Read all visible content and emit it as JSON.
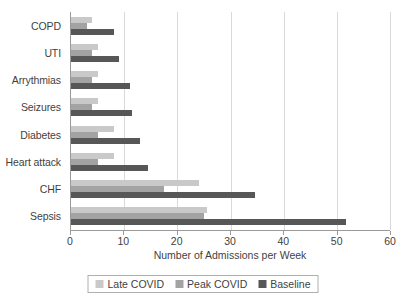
{
  "chart_data": {
    "type": "bar",
    "orientation": "horizontal",
    "title": "",
    "xlabel": "Number of Admissions per Week",
    "ylabel": "",
    "xlim": [
      0,
      60
    ],
    "xticks": [
      0,
      10,
      20,
      30,
      40,
      50,
      60
    ],
    "grid": true,
    "legend_position": "bottom",
    "categories": [
      "COPD",
      "UTI",
      "Arrythmias",
      "Seizures",
      "Diabetes",
      "Heart attack",
      "CHF",
      "Sepsis"
    ],
    "series": [
      {
        "name": "Late COVID",
        "color": "#c9c9c9",
        "values": [
          4,
          5,
          5,
          5,
          8,
          8,
          24,
          25.5
        ]
      },
      {
        "name": "Peak COVID",
        "color": "#a3a3a3",
        "values": [
          3,
          4,
          4,
          4,
          5,
          5,
          17.5,
          25
        ]
      },
      {
        "name": "Baseline",
        "color": "#575757",
        "values": [
          8,
          9,
          11,
          11.5,
          13,
          14.5,
          34.5,
          51.5
        ]
      }
    ]
  }
}
